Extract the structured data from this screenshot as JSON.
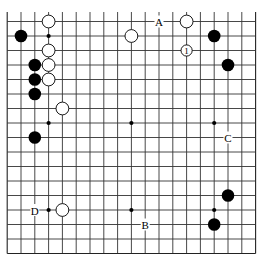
{
  "diagram": {
    "type": "go-board-partial",
    "columns": 19,
    "visible_rows": 17,
    "top_cut_off": true,
    "colors": {
      "black": "#000000",
      "white": "#ffffff",
      "line": "#333333",
      "background": "#ffffff"
    },
    "hoshi": [
      {
        "col": 3,
        "row": 1
      },
      {
        "col": 9,
        "row": 1
      },
      {
        "col": 15,
        "row": 1
      },
      {
        "col": 3,
        "row": 7
      },
      {
        "col": 9,
        "row": 7
      },
      {
        "col": 15,
        "row": 7
      },
      {
        "col": 3,
        "row": 13
      },
      {
        "col": 9,
        "row": 13
      },
      {
        "col": 15,
        "row": 13
      }
    ],
    "stones": [
      {
        "color": "white",
        "col": 3,
        "row": 0
      },
      {
        "color": "black",
        "col": 1,
        "row": 1
      },
      {
        "color": "white",
        "col": 3,
        "row": 2
      },
      {
        "color": "black",
        "col": 2,
        "row": 3
      },
      {
        "color": "white",
        "col": 3,
        "row": 3
      },
      {
        "color": "black",
        "col": 2,
        "row": 4
      },
      {
        "color": "white",
        "col": 3,
        "row": 4
      },
      {
        "color": "black",
        "col": 2,
        "row": 5
      },
      {
        "color": "white",
        "col": 4,
        "row": 6
      },
      {
        "color": "black",
        "col": 2,
        "row": 8
      },
      {
        "color": "white",
        "col": 9,
        "row": 1
      },
      {
        "color": "white",
        "col": 13,
        "row": 0
      },
      {
        "color": "black",
        "col": 15,
        "row": 1
      },
      {
        "color": "white",
        "col": 13,
        "row": 2,
        "number": "1"
      },
      {
        "color": "black",
        "col": 16,
        "row": 3
      },
      {
        "color": "black",
        "col": 16,
        "row": 12
      },
      {
        "color": "black",
        "col": 15,
        "row": 14
      },
      {
        "color": "white",
        "col": 4,
        "row": 13
      }
    ],
    "labels": [
      {
        "text": "A",
        "col": 11,
        "row": 0
      },
      {
        "text": "C",
        "col": 16,
        "row": 8
      },
      {
        "text": "B",
        "col": 10,
        "row": 14
      },
      {
        "text": "D",
        "col": 2,
        "row": 13
      }
    ]
  }
}
